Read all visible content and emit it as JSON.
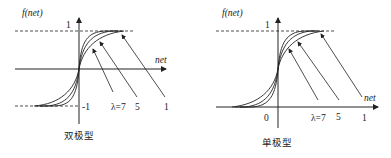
{
  "panels": [
    {
      "id": "bipolar",
      "caption": "双极型",
      "y_axis_label": "f(net)",
      "x_axis_label": "net",
      "upper_tick": "1",
      "lower_tick": "-1",
      "lambda_labels": [
        "λ=7",
        "5",
        "1"
      ]
    },
    {
      "id": "unipolar",
      "caption": "单极型",
      "y_axis_label": "f(net)",
      "x_axis_label": "net",
      "upper_tick": "1",
      "origin_tick": "0",
      "lambda_labels": [
        "λ=7",
        "5",
        "1"
      ]
    }
  ],
  "colors": {
    "line": "#222222",
    "background": "#ffffff"
  }
}
